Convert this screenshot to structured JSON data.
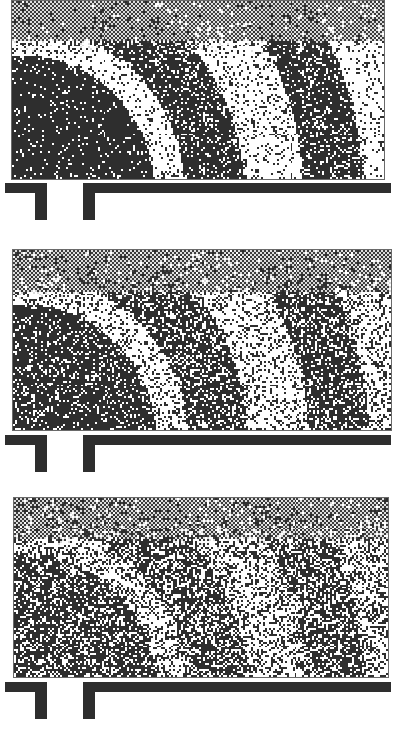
{
  "figure": {
    "panels": [
      {
        "id": "panel-1",
        "noise_level": "low",
        "rect": {
          "x": 11,
          "y": 0,
          "w": 374,
          "h": 180
        },
        "barrier_y": 183,
        "noise": 0.1
      },
      {
        "id": "panel-2",
        "noise_level": "medium",
        "rect": {
          "x": 12,
          "y": 249,
          "w": 380,
          "h": 182
        },
        "barrier_y": 435,
        "noise": 0.28
      },
      {
        "id": "panel-3",
        "noise_level": "high",
        "rect": {
          "x": 13,
          "y": 497,
          "w": 376,
          "h": 181
        },
        "barrier_y": 682,
        "noise": 0.45
      }
    ],
    "barrier": {
      "left_segment": {
        "x": 5,
        "w": 42
      },
      "right_segment": {
        "x": 83,
        "x_end": 391
      },
      "thickness": 10,
      "post_height": 37,
      "post_width": 12
    },
    "colors": {
      "dark": "#2e2e2e",
      "light": "#ffffff",
      "gray_dither": "#8a8a8a",
      "frame": "#6a6a6a"
    }
  }
}
